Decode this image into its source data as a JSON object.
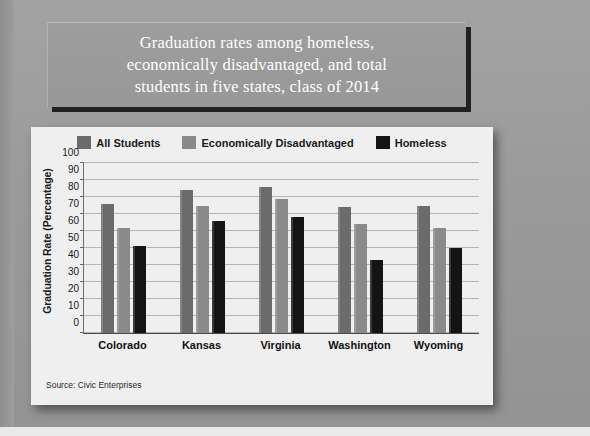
{
  "slide": {
    "title": "Graduation rates among homeless,\neconomically disadvantaged, and total\nstudents in five states, class of 2014",
    "source": "Source: Civic Enterprises",
    "background_color": "#9b9b9b",
    "plaque_color": "#9a9a9a",
    "card_color": "#efefef"
  },
  "chart_data": {
    "type": "bar",
    "title": "Graduation rates among homeless, economically disadvantaged, and total students in five states, class of 2014",
    "xlabel": "",
    "ylabel": "Graduation Rate (Percentage)",
    "ylim": [
      0,
      100
    ],
    "ytick_labels": [
      "100",
      "90",
      "80",
      "70",
      "60",
      "50",
      "40",
      "30",
      "20",
      "10",
      "0"
    ],
    "yticks": [
      100,
      90,
      80,
      70,
      60,
      50,
      40,
      30,
      20,
      10,
      0
    ],
    "grid": true,
    "legend_position": "top-center",
    "categories": [
      "Colorado",
      "Kansas",
      "Virginia",
      "Washington",
      "Wyoming"
    ],
    "series": [
      {
        "name": "All Students",
        "color": "#6b6b6b",
        "values": [
          76,
          84,
          86,
          74,
          75
        ]
      },
      {
        "name": "Economically Disadvantaged",
        "color": "#8a8a8a",
        "values": [
          62,
          75,
          79,
          64,
          62
        ]
      },
      {
        "name": "Homeless",
        "color": "#141414",
        "values": [
          51,
          66,
          68,
          43,
          50
        ]
      }
    ]
  }
}
